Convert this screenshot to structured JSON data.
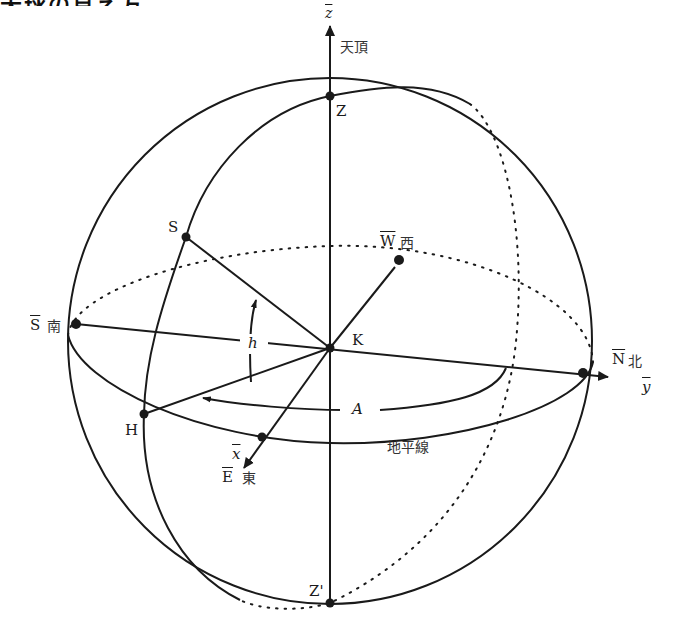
{
  "title": "天球の見え方",
  "diagram": {
    "type": "celestial horizon coordinate system",
    "axes": {
      "z": {
        "symbol": "z",
        "label": "天頂"
      },
      "y": {
        "symbol": "y"
      },
      "x": {
        "symbol": "x"
      }
    },
    "points": {
      "zenith": "Z",
      "nadir": "Z'",
      "center": "K",
      "star": "S",
      "foot": "H",
      "west": {
        "letter": "W",
        "kanji": "西"
      },
      "south": {
        "letter": "S",
        "kanji": "南"
      },
      "north": {
        "letter": "N",
        "kanji": "北"
      },
      "east": {
        "letter": "E",
        "kanji": "東"
      }
    },
    "angles": {
      "altitude": "h",
      "azimuth": "A"
    },
    "horizon_label": "地平線",
    "colors": {
      "line": "#1a1a1a",
      "background": "#ffffff"
    }
  }
}
